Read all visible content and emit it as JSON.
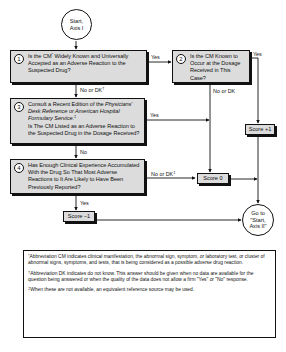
{
  "start_node": {
    "line1": "Start,",
    "line2": "Axis I"
  },
  "questions": [
    {
      "number": "1",
      "text_a": "Is the CM",
      "mark": "*",
      "text_b": " Widely Known and Universally Accepted as an Adverse Reaction to the Suspected Drug?"
    },
    {
      "number": "2",
      "text": "Is the CM Known to Occur at the Dosage Received in This Case?"
    },
    {
      "number": "3",
      "text_a": "Consult a Recent Edition of the ",
      "italic": "Physicians' Desk Reference or American Hospital Formulary Service.",
      "mark": "‡",
      "text_b": "Is The CM Listed as an Adverse Reaction to the Suspected Drug in the Dosage Received?"
    },
    {
      "number": "4",
      "text": "Has Enough Clinical Experience Accumulated With the Drug So That Most Adverse Reactions to It Are Likely to Have Been Previously Reported?"
    }
  ],
  "edge_labels": {
    "q1_yes": "Yes",
    "q1_no": "No or DK",
    "q1_no_mark": "†",
    "q2_yes": "Yes",
    "q2_no": "No or DK",
    "q3_yes": "Yes",
    "q3_no": "No",
    "q4_no": "No or DK",
    "q4_no_mark": "‡",
    "q4_yes": "Yes"
  },
  "scores": {
    "plus1": "Score +1",
    "zero": "Score 0",
    "minus1": "Score –1"
  },
  "end_node": {
    "line1": "Go to",
    "line2": "\"Start,",
    "line3": "Axis II\""
  },
  "footnotes": [
    {
      "mark": "*",
      "text": "Abbreviation CM indicates clinical manifestation, the abnormal sign, symptom, or laboratory test, or cluster of abnormal signs, symptoms, and tests, that is being considered as a possible adverse drug reaction."
    },
    {
      "mark": "†",
      "text": "Abbreviation DK indicates do not know. This answer should be given when no data are available for the question being answered or when the quality of the data does not allow a firm \"Yes\" or \"No\" response."
    },
    {
      "mark": "‡",
      "text": "When these are not available, an equivalent reference source may be used."
    }
  ]
}
